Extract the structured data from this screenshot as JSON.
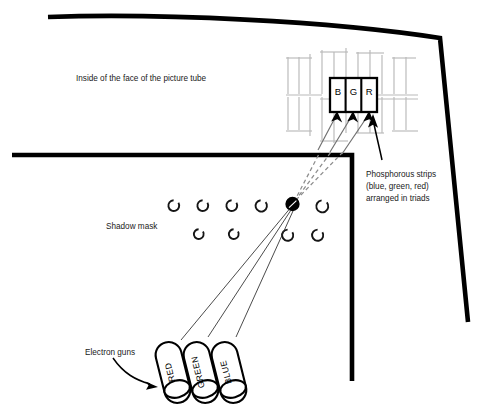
{
  "figure": {
    "background_color": "#ffffff",
    "ink_color": "#000000",
    "grid_color": "#b9b9b9"
  },
  "labels": {
    "tube_face": "Inside of the face of the picture tube",
    "shadow_mask": "Shadow mask",
    "electron_guns": "Electron guns",
    "phosphor_note_line1": "Phosphorous strips",
    "phosphor_note_line2": "(blue, green, red)",
    "phosphor_note_line3": "arranged in triads"
  },
  "phosphor_strips": {
    "letters": [
      "B",
      "G",
      "R"
    ],
    "colors_described": [
      "blue",
      "green",
      "red"
    ],
    "arrangement": "triads"
  },
  "electron_guns": {
    "names": [
      "RED",
      "GREEN",
      "BLUE"
    ],
    "count": 3
  },
  "shadow_mask": {
    "row1_holes": 6,
    "row2_holes": 4,
    "highlighted_hole_index": 5,
    "hole_style": "open ring with gap"
  },
  "beams": {
    "solid_count": 3,
    "dashed_count": 3,
    "note": "three gun beams converge at one shadow mask hole then diverge onto the B, G, R phosphor strips"
  }
}
